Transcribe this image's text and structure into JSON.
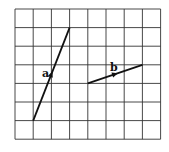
{
  "diagram": {
    "grid": {
      "cols": 8,
      "rows": 7,
      "left": 15,
      "top": 9,
      "cell_w": 18.2,
      "cell_h": 18.6,
      "line_color": "#333333"
    },
    "vectors": [
      {
        "label": "a",
        "from": [
          1,
          6
        ],
        "to": [
          3,
          1
        ],
        "label_pos": [
          42,
          77
        ]
      },
      {
        "label": "b",
        "from": [
          4,
          4
        ],
        "to": [
          7,
          3
        ],
        "label_pos": [
          110,
          71
        ]
      }
    ],
    "colors": {
      "vector": "#111111",
      "background": "#ffffff"
    }
  }
}
